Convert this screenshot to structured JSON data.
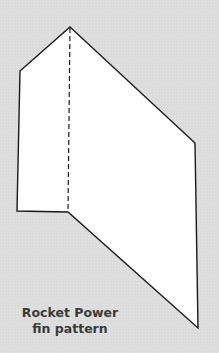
{
  "figure": {
    "caption": {
      "line1": "Rocket Power",
      "line2": "fin pattern"
    },
    "colors": {
      "background": "#dcdcdc",
      "fin_fill": "#ffffff",
      "outline": "#1a1a1a",
      "caption_text": "#3a3a3a"
    },
    "fin_outline_points": "70,27 195,143 198,328 68,212 17,211 20,71",
    "fold_line": {
      "x1": 70,
      "y1": 27,
      "x2": 68,
      "y2": 212,
      "style": "dashed"
    }
  }
}
